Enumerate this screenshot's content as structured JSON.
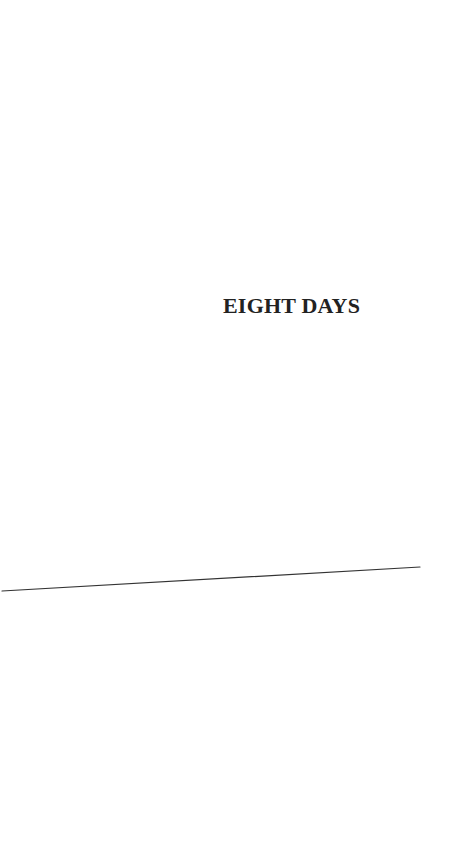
{
  "page": {
    "title": "EIGHT DAYS",
    "colors": {
      "background": "#ffffff",
      "text": "#222222",
      "rule": "#333333"
    }
  }
}
